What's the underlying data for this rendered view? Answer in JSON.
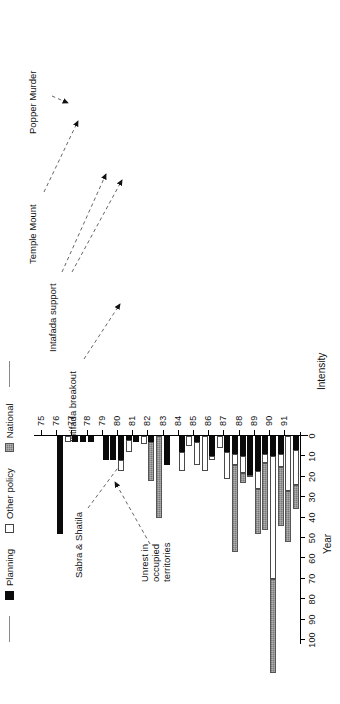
{
  "chart_data": {
    "type": "bar",
    "title": "",
    "subtitle": "",
    "orientation": "vertical-stacked",
    "xlabel": "Year",
    "ylabel": "Intensity",
    "ylim": [
      0,
      100
    ],
    "ytick_values": [
      0,
      10,
      20,
      30,
      40,
      50,
      60,
      70,
      80,
      90,
      100
    ],
    "ytick_labels": [
      "0",
      "10",
      "20",
      "30",
      "40",
      "50",
      "60",
      "70",
      "80",
      "90",
      "100"
    ],
    "xtick_labels": [
      "75",
      "76",
      "77",
      "78",
      "79",
      "80",
      "81",
      "82",
      "83",
      "84",
      "85",
      "86",
      "87",
      "88",
      "89",
      "90",
      "91"
    ],
    "grid": false,
    "legend_position": "top-left",
    "series": [
      {
        "name": "Planning",
        "color": "#0a0a0a",
        "style": "solid-black"
      },
      {
        "name": "Other policy",
        "color": "#ffffff",
        "style": "open-white"
      },
      {
        "name": "National",
        "color": "#7a7a7a",
        "style": "hatched-gray"
      }
    ],
    "categories": [
      "75H1",
      "75H2",
      "76H1",
      "76H2",
      "77H1",
      "77H2",
      "78H1",
      "78H2",
      "79H1",
      "79H2",
      "80H1",
      "80H2",
      "81H1",
      "81H2",
      "82H1",
      "82H2",
      "83H1",
      "83H2",
      "84H1",
      "84H2",
      "85H1",
      "85H2",
      "86H1",
      "86H2",
      "87H1",
      "87H2",
      "88H1",
      "88H2",
      "89H1",
      "89H2",
      "90H1",
      "90H2",
      "91H1",
      "91H2"
    ],
    "stacks": [
      {
        "category": "75H1",
        "planning": 0,
        "other": 0,
        "national": 0
      },
      {
        "category": "75H2",
        "planning": 0,
        "other": 0,
        "national": 0
      },
      {
        "category": "76H1",
        "planning": 48,
        "other": 0,
        "national": 0
      },
      {
        "category": "76H2",
        "planning": 0,
        "other": 3,
        "national": 0
      },
      {
        "category": "77H1",
        "planning": 3,
        "other": 0,
        "national": 0
      },
      {
        "category": "77H2",
        "planning": 3,
        "other": 0,
        "national": 0
      },
      {
        "category": "78H1",
        "planning": 3,
        "other": 0,
        "national": 0
      },
      {
        "category": "78H2",
        "planning": 0,
        "other": 0,
        "national": 0
      },
      {
        "category": "79H1",
        "planning": 12,
        "other": 0,
        "national": 0
      },
      {
        "category": "79H2",
        "planning": 12,
        "other": 0,
        "national": 0
      },
      {
        "category": "80H1",
        "planning": 12,
        "other": 5,
        "national": 0
      },
      {
        "category": "80H2",
        "planning": 2,
        "other": 6,
        "national": 0
      },
      {
        "category": "81H1",
        "planning": 3,
        "other": 0,
        "national": 0
      },
      {
        "category": "81H2",
        "planning": 0,
        "other": 4,
        "national": 0
      },
      {
        "category": "82H1",
        "planning": 3,
        "other": 0,
        "national": 19
      },
      {
        "category": "82H2",
        "planning": 0,
        "other": 0,
        "national": 40
      },
      {
        "category": "83H1",
        "planning": 14,
        "other": 0,
        "national": 0
      },
      {
        "category": "83H2",
        "planning": 0,
        "other": 0,
        "national": 0
      },
      {
        "category": "84H1",
        "planning": 8,
        "other": 9,
        "national": 0
      },
      {
        "category": "84H2",
        "planning": 0,
        "other": 5,
        "national": 0
      },
      {
        "category": "85H1",
        "planning": 3,
        "other": 11,
        "national": 0
      },
      {
        "category": "85H2",
        "planning": 0,
        "other": 17,
        "national": 0
      },
      {
        "category": "86H1",
        "planning": 10,
        "other": 2,
        "national": 0
      },
      {
        "category": "86H2",
        "planning": 0,
        "other": 6,
        "national": 0
      },
      {
        "category": "87H1",
        "planning": 8,
        "other": 13,
        "national": 0
      },
      {
        "category": "87H2",
        "planning": 9,
        "other": 5,
        "national": 43
      },
      {
        "category": "88H1",
        "planning": 10,
        "other": 8,
        "national": 5
      },
      {
        "category": "88H2",
        "planning": 19,
        "other": 1,
        "national": 0
      },
      {
        "category": "89H1",
        "planning": 17,
        "other": 9,
        "national": 22
      },
      {
        "category": "89H2",
        "planning": 9,
        "other": 4,
        "national": 33
      },
      {
        "category": "90H1",
        "planning": 10,
        "other": 60,
        "national": 46
      },
      {
        "category": "90H2",
        "planning": 9,
        "other": 6,
        "national": 29
      },
      {
        "category": "91H1",
        "planning": 0,
        "other": 27,
        "national": 25
      },
      {
        "category": "91H2",
        "planning": 7,
        "other": 17,
        "national": 12
      }
    ],
    "annotations": [
      {
        "text": "Popper Murder",
        "target": "90H1"
      },
      {
        "text": "Temple Mount",
        "target": "90H2"
      },
      {
        "text": "Intafada support",
        "target": "89H1"
      },
      {
        "text": "Intifada breakout",
        "target": "87H2"
      },
      {
        "text": "Sabra & Shatila",
        "target": "82H2"
      },
      {
        "text": "Unrest in\noccupied\nterritories",
        "target": "82H1"
      }
    ]
  },
  "legend": {
    "items": [
      {
        "label": "Planning"
      },
      {
        "label": "Other policy"
      },
      {
        "label": "National"
      }
    ]
  },
  "axes": {
    "x_title": "Year",
    "y_title": "Intensity"
  }
}
